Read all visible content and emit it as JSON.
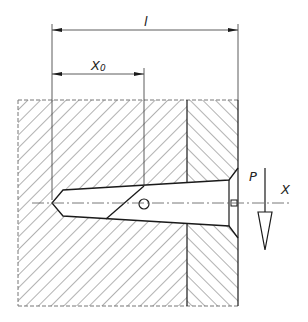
{
  "diagram": {
    "type": "technical-cross-section",
    "labels": {
      "length": "l",
      "position_main": "X",
      "position_sub": "0",
      "force": "P",
      "axis": "X"
    },
    "colors": {
      "line": "#1a1a1a",
      "hatch": "#555555",
      "background": "#ffffff"
    },
    "elements": [
      "dimension-l",
      "dimension-x0",
      "hatched-block-left",
      "hatched-block-right",
      "tapered-pin-cavity",
      "pivot-circle",
      "centerline-x",
      "force-arrow-p"
    ]
  }
}
